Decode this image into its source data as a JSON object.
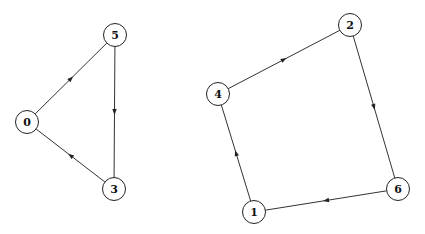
{
  "diagram": {
    "type": "directed-graph",
    "nodes": [
      {
        "id": "0",
        "label": "0",
        "x": 27,
        "y": 122
      },
      {
        "id": "5",
        "label": "5",
        "x": 115,
        "y": 35
      },
      {
        "id": "3",
        "label": "3",
        "x": 114,
        "y": 189
      },
      {
        "id": "2",
        "label": "2",
        "x": 350,
        "y": 25
      },
      {
        "id": "4",
        "label": "4",
        "x": 218,
        "y": 94
      },
      {
        "id": "6",
        "label": "6",
        "x": 398,
        "y": 189
      },
      {
        "id": "1",
        "label": "1",
        "x": 254,
        "y": 212
      }
    ],
    "edges": [
      {
        "from": "0",
        "to": "5"
      },
      {
        "from": "5",
        "to": "3"
      },
      {
        "from": "3",
        "to": "0"
      },
      {
        "from": "4",
        "to": "2"
      },
      {
        "from": "2",
        "to": "6"
      },
      {
        "from": "6",
        "to": "1"
      },
      {
        "from": "1",
        "to": "4"
      }
    ],
    "components": [
      {
        "name": "cycle-a",
        "nodes": [
          "0",
          "5",
          "3"
        ]
      },
      {
        "name": "cycle-b",
        "nodes": [
          "4",
          "2",
          "6",
          "1"
        ]
      }
    ]
  }
}
